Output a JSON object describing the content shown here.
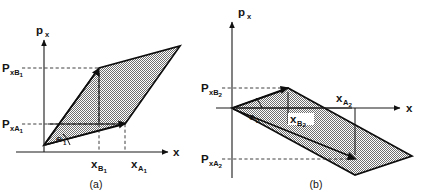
{
  "figure": {
    "title_visible": false,
    "background_color": "#ffffff",
    "ink_color": "#111111",
    "shading_color": "#8a8a8a",
    "panels": [
      {
        "id": "panel-a",
        "caption": "(a)",
        "axes": {
          "y_axis_label": "p",
          "y_axis_label_sub": "x",
          "x_axis_label": "x"
        },
        "tick_labels": {
          "y_upper": {
            "main": "P",
            "sub": "xB",
            "sub2": "1"
          },
          "y_lower": {
            "main": "P",
            "sub": "xA",
            "sub2": "1"
          },
          "x_left": {
            "main": "x",
            "sub": "B",
            "sub2": "1"
          },
          "x_right": {
            "main": "x",
            "sub": "A",
            "sub2": "1"
          }
        },
        "angle_label": {
          "main": "Θ",
          "sub": "1"
        },
        "shape": "parallelogram",
        "orientation": "positive-slope"
      },
      {
        "id": "panel-b",
        "caption": "(b)",
        "axes": {
          "y_axis_label": "p",
          "y_axis_label_sub": "x",
          "x_axis_label": "x"
        },
        "tick_labels": {
          "y_upper": {
            "main": "P",
            "sub": "xB",
            "sub2": "2"
          },
          "y_lower": {
            "main": "P",
            "sub": "xA",
            "sub2": "2"
          },
          "x_inner": {
            "main": "x",
            "sub": "B",
            "sub2": "2"
          },
          "x_outer": {
            "main": "x",
            "sub": "A",
            "sub2": "2"
          }
        },
        "angle_label": {
          "main": "Θ",
          "sub": "2"
        },
        "shape": "parallelogram",
        "orientation": "negative-slope"
      }
    ]
  }
}
